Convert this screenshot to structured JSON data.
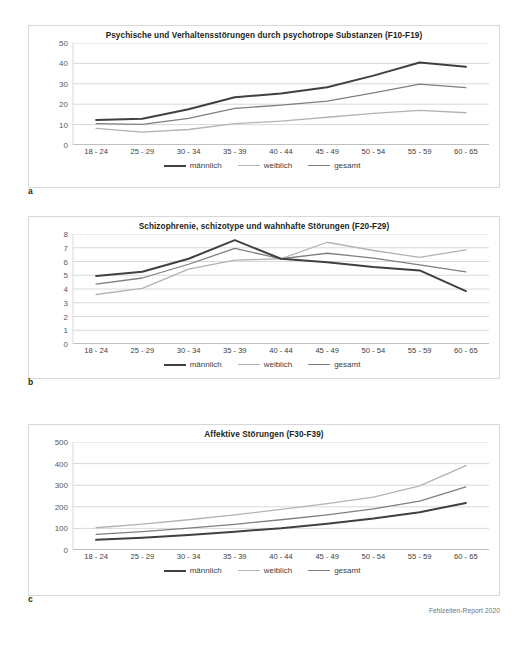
{
  "footer": {
    "note": "Fehlzeiten-Report 2020"
  },
  "panels": [
    {
      "letter": "a",
      "chart_ref": 0
    },
    {
      "letter": "b",
      "chart_ref": 1
    },
    {
      "letter": "c",
      "chart_ref": 2
    }
  ],
  "legend": {
    "items": [
      {
        "label": "männlich",
        "color": "#404040",
        "width": 2.0
      },
      {
        "label": "weiblich",
        "color": "#b3b3b3",
        "width": 1.3
      },
      {
        "label": "gesamt",
        "color": "#7f7f7f",
        "width": 1.3
      }
    ]
  },
  "chart_data": [
    {
      "type": "line",
      "title": "Psychische und Verhaltensstörungen durch psychotrope Substanzen (F10-F19)",
      "xlabel": "",
      "ylabel": "",
      "categories": [
        "18 - 24",
        "25 - 29",
        "30 - 34",
        "35 - 39",
        "40 - 44",
        "45 - 49",
        "50 - 54",
        "55 - 59",
        "60 - 65"
      ],
      "ylim": [
        0,
        50
      ],
      "yticks": [
        0,
        10,
        20,
        30,
        40,
        50
      ],
      "grid": true,
      "legend_position": "bottom",
      "series": [
        {
          "name": "männlich",
          "color": "#404040",
          "width": 2.0,
          "values": [
            12.3,
            12.9,
            17.5,
            23.4,
            25.2,
            28.3,
            34.0,
            40.4,
            38.3
          ]
        },
        {
          "name": "weiblich",
          "color": "#b3b3b3",
          "width": 1.3,
          "values": [
            8.1,
            6.3,
            7.6,
            10.5,
            11.7,
            13.6,
            15.5,
            17.0,
            15.8
          ]
        },
        {
          "name": "gesamt",
          "color": "#7f7f7f",
          "width": 1.3,
          "values": [
            10.5,
            10.1,
            13.0,
            18.0,
            19.5,
            21.5,
            25.5,
            29.8,
            28.1
          ]
        }
      ]
    },
    {
      "type": "line",
      "title": "Schizophrenie, schizotype und wahnhafte Störungen (F20-F29)",
      "xlabel": "",
      "ylabel": "",
      "categories": [
        "18 - 24",
        "25 - 29",
        "30 - 34",
        "35 - 39",
        "40 - 44",
        "45 - 49",
        "50 - 54",
        "55 - 59",
        "60 - 65"
      ],
      "ylim": [
        0,
        8
      ],
      "yticks": [
        0,
        1,
        2,
        3,
        4,
        5,
        6,
        7,
        8
      ],
      "grid": true,
      "legend_position": "bottom",
      "series": [
        {
          "name": "männlich",
          "color": "#404040",
          "width": 2.0,
          "values": [
            4.95,
            5.25,
            6.2,
            7.55,
            6.2,
            5.95,
            5.6,
            5.35,
            3.85
          ]
        },
        {
          "name": "weiblich",
          "color": "#b3b3b3",
          "width": 1.3,
          "values": [
            3.6,
            4.05,
            5.45,
            6.1,
            6.2,
            7.4,
            6.8,
            6.3,
            6.85
          ]
        },
        {
          "name": "gesamt",
          "color": "#7f7f7f",
          "width": 1.3,
          "values": [
            4.35,
            4.8,
            5.8,
            6.95,
            6.2,
            6.6,
            6.25,
            5.75,
            5.25
          ]
        }
      ]
    },
    {
      "type": "line",
      "title": "Affektive Störungen (F30-F39)",
      "xlabel": "",
      "ylabel": "",
      "categories": [
        "18 - 24",
        "25 - 29",
        "30 - 34",
        "35 - 39",
        "40 - 44",
        "45 - 49",
        "50 - 54",
        "55 - 59",
        "60 - 65"
      ],
      "ylim": [
        0,
        500
      ],
      "yticks": [
        0,
        100,
        200,
        300,
        400,
        500
      ],
      "grid": true,
      "legend_position": "bottom",
      "series": [
        {
          "name": "männlich",
          "color": "#404040",
          "width": 2.0,
          "values": [
            47,
            57,
            70,
            85,
            101,
            122,
            146,
            175,
            218
          ]
        },
        {
          "name": "weiblich",
          "color": "#b3b3b3",
          "width": 1.3,
          "values": [
            103,
            120,
            140,
            163,
            188,
            215,
            245,
            297,
            391
          ]
        },
        {
          "name": "gesamt",
          "color": "#7f7f7f",
          "width": 1.3,
          "values": [
            72,
            85,
            101,
            119,
            140,
            163,
            190,
            226,
            292
          ]
        }
      ]
    }
  ]
}
